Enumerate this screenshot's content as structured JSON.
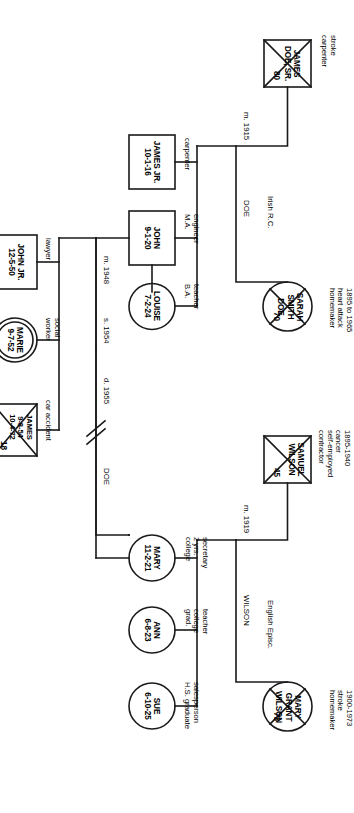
{
  "diagram": {
    "type": "genogram",
    "orientation": "rotated-90"
  },
  "people": [
    {
      "id": "samuel",
      "name": "SAMUEL\nWILSON",
      "shape": "square",
      "deceased": true,
      "age": "45",
      "annotation": "1895-1940\ncancer\nself-employed\ncontractor"
    },
    {
      "id": "mary_grant",
      "name": "MARY\nGRANT\nWILSON",
      "shape": "circle",
      "deceased": true,
      "age": "73",
      "annotation": "1900-1973\nstroke\nhomemaker"
    },
    {
      "id": "james_sr",
      "name": "JAMES\nDOE, SR.",
      "shape": "square",
      "deceased": true,
      "age": "80",
      "annotation": "stroke\ncarpenter"
    },
    {
      "id": "sarah",
      "name": "SARAH\nSMITH\nDOE",
      "shape": "circle",
      "deceased": true,
      "age": "70",
      "annotation": "1895 to 1965\nheart attack\nhomemaker"
    },
    {
      "id": "mary",
      "name": "MARY\n11-2-21",
      "shape": "circle",
      "deceased": false,
      "age": "",
      "annotation": "secretary\n2 yrs.\ncollege"
    },
    {
      "id": "ann",
      "name": "ANN\n6-8-23",
      "shape": "circle",
      "deceased": false,
      "age": "",
      "annotation": "teacher\ncollege\ngrad."
    },
    {
      "id": "sue",
      "name": "SUE\n6-10-25",
      "shape": "circle",
      "deceased": false,
      "age": "",
      "annotation": "salesperson\nH.S. graduate"
    },
    {
      "id": "james_jr",
      "name": "JAMES JR.\n10-1-16",
      "shape": "square",
      "deceased": false,
      "age": "",
      "annotation": "carpenter"
    },
    {
      "id": "john",
      "name": "JOHN\n9-1-20",
      "shape": "square",
      "deceased": false,
      "age": "",
      "annotation": "engineer\nM.A."
    },
    {
      "id": "louise",
      "name": "LOUISE\n7-2-24",
      "shape": "circle",
      "deceased": false,
      "age": "",
      "annotation": "teacher\nB.A."
    },
    {
      "id": "john_jr",
      "name": "JOHN JR.\n12-5-50",
      "shape": "square",
      "deceased": false,
      "age": "",
      "annotation": "lawyer"
    },
    {
      "id": "marie",
      "name": "MARIE\n9-7-52",
      "shape": "double-circle",
      "deceased": false,
      "age": "",
      "annotation": "social\nworker"
    },
    {
      "id": "james_grandson",
      "name": "JAMES\n9-8-54\n10-4-72",
      "shape": "square",
      "deceased": true,
      "age": "18",
      "annotation": "car accident"
    }
  ],
  "relationships": {
    "wilson_marriage": "m. 1919",
    "wilson_family": "WILSON",
    "wilson_ethnicity": "English Episc.",
    "doe_marriage": "m. 1915",
    "doe_family": "DOE",
    "doe_ethnicity": "Irish R.C.",
    "union_marriage": "m. 1948",
    "union_separation": "s. 1954",
    "union_divorce": "d. 1955",
    "union_family": "DOE"
  },
  "colors": {
    "stroke": "#1a1a1a",
    "background": "#ffffff",
    "text": "#000000"
  }
}
